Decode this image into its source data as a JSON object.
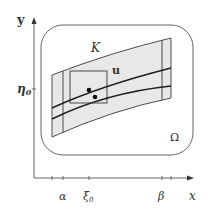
{
  "figure": {
    "type": "mathematical-diagram",
    "axes": {
      "x_label": "x",
      "y_label": "y",
      "x_ticks": [
        {
          "label": "",
          "x": 52
        },
        {
          "label": "α",
          "x": 63
        },
        {
          "label": "ξ0",
          "x": 89
        },
        {
          "label": "β",
          "x": 162
        },
        {
          "label": "",
          "x": 171
        }
      ],
      "y_ticks": [
        {
          "label": "η0",
          "y": 89
        }
      ]
    },
    "regions": {
      "omega_label": "Ω",
      "k_label": "K"
    },
    "curves": {
      "u_label": "u"
    },
    "labels": {
      "y_axis": "y",
      "x_axis": "x",
      "eta0_base": "η",
      "eta0_sub": "0",
      "xi0_base": "ξ",
      "xi0_sub": "0",
      "alpha": "α",
      "beta": "β",
      "K": "K",
      "u": "u",
      "Omega": "Ω"
    },
    "colors": {
      "line": "#3a3a3a",
      "shade": "#e6e6e6",
      "curve": "#222222",
      "axis": "#555555"
    }
  }
}
